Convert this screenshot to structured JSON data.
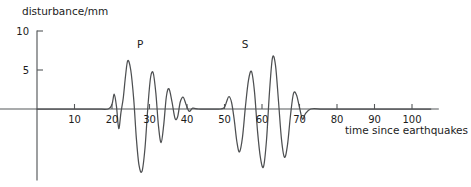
{
  "chart_data": {
    "type": "line",
    "title": "",
    "xlabel": "time since earthquakes",
    "ylabel": "disturbance/mm",
    "xlim": [
      0,
      107
    ],
    "ylim": [
      -10,
      10
    ],
    "grid": false,
    "legend_position": "none",
    "x_ticks": [
      10,
      20,
      30,
      40,
      50,
      60,
      70,
      80,
      90,
      100
    ],
    "x_tick_labels": [
      "10",
      "20",
      "30",
      "40",
      "50",
      "60",
      "70",
      "80",
      "90",
      "100"
    ],
    "y_ticks": [
      5,
      10
    ],
    "y_tick_labels": [
      "5",
      "10"
    ],
    "annotations": [
      {
        "label": "P",
        "x": 27.5,
        "y": 7.8
      },
      {
        "label": "S",
        "x": 55.5,
        "y": 7.8
      }
    ],
    "series": [
      {
        "name": "seismogram trace",
        "color": "#4d4f51",
        "x": [
          0,
          4,
          8,
          12,
          16,
          19,
          20,
          20.6,
          21.2,
          21.8,
          22.4,
          23,
          23.6,
          24.2,
          25,
          25.8,
          26.5,
          27.2,
          28,
          28.8,
          29.6,
          30.3,
          31,
          31.7,
          32.4,
          33.1,
          33.8,
          34.5,
          35.2,
          36,
          36.8,
          37.5,
          38.2,
          39,
          39.8,
          40.6,
          41.5,
          43,
          45,
          47,
          49,
          50,
          50.6,
          51.2,
          51.9,
          52.6,
          53.3,
          54,
          54.8,
          55.6,
          56.4,
          57.2,
          58,
          58.8,
          59.6,
          60.4,
          61.2,
          62,
          62.8,
          63.6,
          64.4,
          65.2,
          66,
          66.8,
          67.6,
          68.4,
          69.2,
          70,
          70.8,
          71.6,
          73,
          76,
          80,
          85,
          90,
          95,
          100,
          105
        ],
        "y": [
          0,
          0,
          0,
          0,
          0,
          0,
          0.6,
          1.9,
          0.3,
          -2.5,
          -0.4,
          1.4,
          4.2,
          6.2,
          5.0,
          1.2,
          -3.8,
          -7.2,
          -8.0,
          -5.0,
          0.5,
          4.1,
          4.6,
          2.0,
          -2.2,
          -4.3,
          -2.0,
          1.6,
          2.6,
          0.9,
          -1.2,
          -1.0,
          0.9,
          1.5,
          0.5,
          -0.3,
          0.1,
          0,
          0,
          0,
          0,
          0.2,
          1.0,
          1.6,
          0.8,
          -1.4,
          -4.2,
          -5.5,
          -3.6,
          0.4,
          3.7,
          4.8,
          2.2,
          -2.8,
          -6.3,
          -7.4,
          -4.0,
          2.2,
          6.6,
          5.6,
          1.0,
          -3.9,
          -6.2,
          -4.6,
          -0.8,
          2.0,
          1.8,
          0.2,
          -1.3,
          -0.6,
          0,
          0,
          0,
          0,
          0,
          0,
          0,
          0
        ]
      }
    ]
  },
  "axes": {
    "y_axis_label": "disturbance/mm",
    "x_axis_label": "time since earthquakes"
  }
}
